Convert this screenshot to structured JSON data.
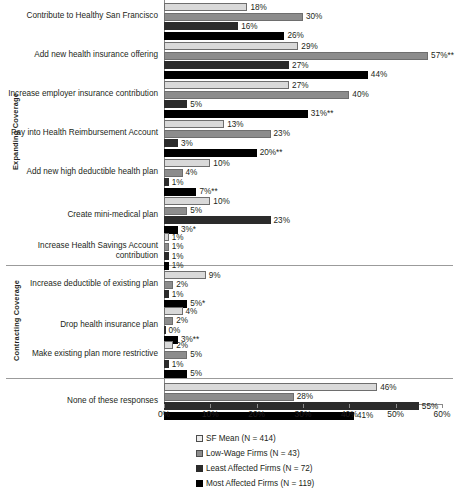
{
  "chart_data": {
    "type": "bar",
    "orientation": "horizontal",
    "title": "",
    "xlabel": "",
    "ylabel": "",
    "xlim": [
      0,
      60
    ],
    "xtick_labels": [
      "0%",
      "10%",
      "20%",
      "30%",
      "40%",
      "50%",
      "60%"
    ],
    "xticks": [
      0,
      10,
      20,
      30,
      40,
      50,
      60
    ],
    "grid": false,
    "legend_position": "bottom",
    "series": [
      {
        "name": "SF Mean (N = 414)",
        "color": "#d9d9d9"
      },
      {
        "name": "Low-Wage Firms (N = 43)",
        "color": "#8c8c8c"
      },
      {
        "name": "Least Affected Firms (N = 72)",
        "color": "#2b2b2b"
      },
      {
        "name": "Most Affected Firms (N = 119)",
        "color": "#000000"
      }
    ],
    "groups": [
      {
        "name": "Expanding Coverage",
        "categories": [
          {
            "label": "Contribute to Healthy San Francisco",
            "values": [
              18,
              30,
              16,
              26
            ],
            "labels": [
              "18%",
              "30%",
              "16%",
              "26%"
            ]
          },
          {
            "label": "Add new health insurance offering",
            "values": [
              29,
              57,
              27,
              44
            ],
            "labels": [
              "29%",
              "57%**",
              "27%",
              "44%"
            ]
          },
          {
            "label": "Increase employer insurance contribution",
            "values": [
              27,
              40,
              5,
              31
            ],
            "labels": [
              "27%",
              "40%",
              "5%",
              "31%**"
            ]
          },
          {
            "label": "Pay into Health Reimbursement Account",
            "values": [
              13,
              23,
              3,
              20
            ],
            "labels": [
              "13%",
              "23%",
              "3%",
              "20%**"
            ]
          },
          {
            "label": "Add new high deductible health plan",
            "values": [
              10,
              4,
              1,
              7
            ],
            "labels": [
              "10%",
              "4%",
              "1%",
              "7%**"
            ]
          },
          {
            "label": "Create mini-medical plan",
            "values": [
              10,
              5,
              23,
              3
            ],
            "labels": [
              "10%",
              "5%",
              "23%",
              "3%*"
            ]
          },
          {
            "label": "Increase Health Savings Account contribution",
            "values": [
              1,
              1,
              1,
              1
            ],
            "labels": [
              "1%",
              "1%",
              "1%",
              "1%"
            ]
          }
        ]
      },
      {
        "name": "Contracting Coverage",
        "categories": [
          {
            "label": "Increase deductible of existing plan",
            "values": [
              9,
              2,
              1,
              5
            ],
            "labels": [
              "9%",
              "2%",
              "1%",
              "5%*"
            ]
          },
          {
            "label": "Drop health insurance plan",
            "values": [
              4,
              2,
              0,
              3
            ],
            "labels": [
              "4%",
              "2%",
              "0%",
              "3%**"
            ]
          },
          {
            "label": "Make existing plan more restrictive",
            "values": [
              2,
              5,
              1,
              5
            ],
            "labels": [
              "2%",
              "5%",
              "1%",
              "5%"
            ]
          }
        ]
      },
      {
        "name": "",
        "categories": [
          {
            "label": "None of these responses",
            "values": [
              46,
              28,
              55,
              41
            ],
            "labels": [
              "46%",
              "28%",
              "55%",
              "41%"
            ]
          }
        ]
      }
    ]
  }
}
